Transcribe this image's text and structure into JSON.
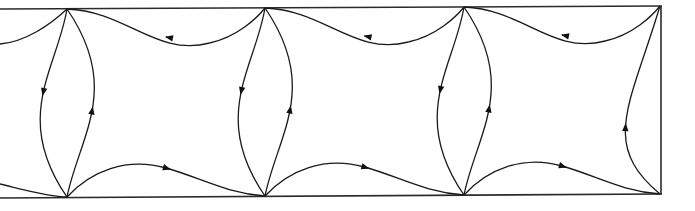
{
  "diagram": {
    "type": "periodic-flow-cells",
    "colors": {
      "line": "#1a1a1a",
      "frame": "#2a2a2a",
      "background": "#ffffff"
    },
    "frame": {
      "top": {
        "x1": 0,
        "y1": 9,
        "x2": 662,
        "y2": 6
      },
      "bottom": {
        "x1": 0,
        "y1": 198,
        "x2": 662,
        "y2": 194
      },
      "right": {
        "x1": 661,
        "y1": 6,
        "x2": 661,
        "y2": 194
      }
    },
    "vertices": {
      "top": [
        [
          67,
          9
        ],
        [
          265,
          8
        ],
        [
          464,
          7
        ],
        [
          660,
          6
        ]
      ],
      "bottom": [
        [
          67,
          197
        ],
        [
          265,
          196
        ],
        [
          464,
          195
        ],
        [
          660,
          194
        ]
      ]
    },
    "cells": [
      {
        "index": 0,
        "top_arrow_direction": "left",
        "bottom_arrow_direction": "right",
        "left_outer_arrow": "down",
        "left_inner_arrow": "up"
      },
      {
        "index": 1,
        "top_arrow_direction": "left",
        "bottom_arrow_direction": "right",
        "left_outer_arrow": "down",
        "left_inner_arrow": "up"
      },
      {
        "index": 2,
        "top_arrow_direction": "left",
        "bottom_arrow_direction": "right",
        "left_outer_arrow": "down",
        "left_inner_arrow": "up",
        "right_arrow": "up"
      }
    ],
    "edge_stubs": {
      "top_left": "curve entering from left edge into first top vertex",
      "bottom_left": "curve entering from left edge into first bottom vertex"
    }
  }
}
